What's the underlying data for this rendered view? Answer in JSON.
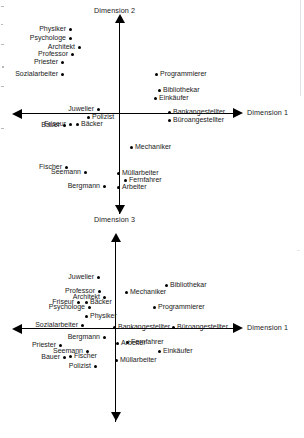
{
  "figure": {
    "type": "two-panel-scatter"
  },
  "chart_data": [
    {
      "id": "plot-dim2",
      "type": "scatter",
      "title": "",
      "xlabel": "Dimension 1",
      "ylabel": "Dimension 2",
      "axis_labels": {
        "x_right": "Dimension 1",
        "y_up": "Dimension 2",
        "y_down": "Dimension 3"
      },
      "grid": false,
      "legend": "none",
      "origin_px": [
        119,
        113
      ],
      "points": [
        {
          "label": "Physiker",
          "px": [
            70,
            29
          ],
          "side": "r"
        },
        {
          "label": "Psychologe",
          "px": [
            70,
            38
          ],
          "side": "r"
        },
        {
          "label": "Architekt",
          "px": [
            79,
            47
          ],
          "side": "r"
        },
        {
          "label": "Professor",
          "px": [
            72,
            54
          ],
          "side": "r"
        },
        {
          "label": "Priester",
          "px": [
            62,
            62
          ],
          "side": "r"
        },
        {
          "label": "Sozialarbeiter",
          "px": [
            62,
            74
          ],
          "side": "r"
        },
        {
          "label": "Programmierer",
          "px": [
            156,
            74
          ],
          "side": "l"
        },
        {
          "label": "Bibliothekar",
          "px": [
            159,
            90
          ],
          "side": "l"
        },
        {
          "label": "Einkäufer",
          "px": [
            155,
            98
          ],
          "side": "l"
        },
        {
          "label": "Juwelier",
          "px": [
            98,
            109
          ],
          "side": "r"
        },
        {
          "label": "Bankangestellter",
          "px": [
            169,
            112
          ],
          "side": "l"
        },
        {
          "label": "Büroangestellter",
          "px": [
            169,
            120
          ],
          "side": "l"
        },
        {
          "label": "Polizist",
          "px": [
            88,
            117
          ],
          "side": "l"
        },
        {
          "label": "Friseur",
          "px": [
            70,
            124
          ],
          "side": "r"
        },
        {
          "label": "Bäcker",
          "px": [
            77,
            124
          ],
          "side": "l"
        },
        {
          "label": "Bauer",
          "px": [
            64,
            125
          ],
          "side": "r"
        },
        {
          "label": "Mechaniker",
          "px": [
            131,
            147
          ],
          "side": "l"
        },
        {
          "label": "Fischer",
          "px": [
            66,
            167
          ],
          "side": "r"
        },
        {
          "label": "Seemann",
          "px": [
            85,
            172
          ],
          "side": "r"
        },
        {
          "label": "Müllarbeiter",
          "px": [
            118,
            173
          ],
          "side": "l"
        },
        {
          "label": "Fernfahrer",
          "px": [
            125,
            180
          ],
          "side": "l"
        },
        {
          "label": "Bergmann",
          "px": [
            104,
            186
          ],
          "side": "r"
        },
        {
          "label": "Arbeiter",
          "px": [
            118,
            187
          ],
          "side": "l"
        }
      ]
    },
    {
      "id": "plot-dim3",
      "type": "scatter",
      "title": "",
      "xlabel": "Dimension 1",
      "ylabel": "Dimension 3",
      "axis_labels": {
        "x_right": "Dimension 1",
        "y_up": "Dimension 3"
      },
      "grid": false,
      "legend": "none",
      "origin_px": [
        115,
        328
      ],
      "points": [
        {
          "label": "Juwelier",
          "px": [
            98,
            277
          ],
          "side": "r"
        },
        {
          "label": "Bibliothekar",
          "px": [
            166,
            285
          ],
          "side": "l"
        },
        {
          "label": "Professor",
          "px": [
            99,
            291
          ],
          "side": "r"
        },
        {
          "label": "Mechaniker",
          "px": [
            126,
            292
          ],
          "side": "l"
        },
        {
          "label": "Architekt",
          "px": [
            104,
            297
          ],
          "side": "r"
        },
        {
          "label": "Friseur",
          "px": [
            78,
            302
          ],
          "side": "r"
        },
        {
          "label": "Bäcker",
          "px": [
            86,
            302
          ],
          "side": "l"
        },
        {
          "label": "Psychologe",
          "px": [
            89,
            307
          ],
          "side": "r"
        },
        {
          "label": "Programmierer",
          "px": [
            154,
            307
          ],
          "side": "l"
        },
        {
          "label": "Physiker",
          "px": [
            86,
            316
          ],
          "side": "l"
        },
        {
          "label": "Sozialarbeiter",
          "px": [
            82,
            325
          ],
          "side": "r"
        },
        {
          "label": "Bankangestellter",
          "px": [
            114,
            327
          ],
          "side": "l"
        },
        {
          "label": "Büroangestellter",
          "px": [
            173,
            327
          ],
          "side": "l"
        },
        {
          "label": "Bergmann",
          "px": [
            104,
            337
          ],
          "side": "r"
        },
        {
          "label": "Fernfahrer",
          "px": [
            127,
            342
          ],
          "side": "l"
        },
        {
          "label": "Arbeiter",
          "px": [
            117,
            343
          ],
          "side": "l"
        },
        {
          "label": "Priester",
          "px": [
            60,
            345
          ],
          "side": "r"
        },
        {
          "label": "Seemann",
          "px": [
            87,
            351
          ],
          "side": "r"
        },
        {
          "label": "Einkäufer",
          "px": [
            159,
            351
          ],
          "side": "l"
        },
        {
          "label": "Fischer",
          "px": [
            70,
            356
          ],
          "side": "l"
        },
        {
          "label": "Bauer",
          "px": [
            64,
            357
          ],
          "side": "r"
        },
        {
          "label": "Müllarbeiter",
          "px": [
            116,
            360
          ],
          "side": "l"
        },
        {
          "label": "Polizist",
          "px": [
            95,
            366
          ],
          "side": "r"
        }
      ]
    }
  ]
}
